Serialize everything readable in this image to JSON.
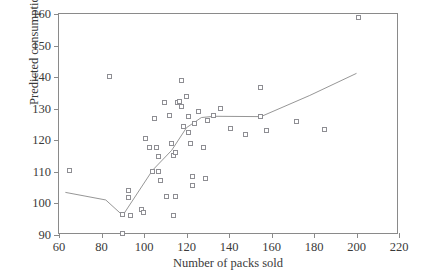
{
  "chart_data": {
    "type": "scatter",
    "title": "",
    "xlabel": "Number of packs sold",
    "ylabel": "Predicted consumption",
    "xlim": [
      60,
      220
    ],
    "ylim": [
      90,
      160
    ],
    "xticks": [
      60,
      80,
      100,
      120,
      140,
      160,
      180,
      200,
      220
    ],
    "yticks": [
      90,
      100,
      110,
      120,
      130,
      140,
      150,
      160
    ],
    "grid": false,
    "legend": null,
    "marker": "open-square",
    "marker_color": "#8e8e93",
    "line_color": "#8a8a8a",
    "axis_color": "#8a8a8a",
    "points": [
      {
        "x": 65,
        "y": 110.2
      },
      {
        "x": 84,
        "y": 140.0
      },
      {
        "x": 90,
        "y": 96.2
      },
      {
        "x": 90,
        "y": 90.4
      },
      {
        "x": 93,
        "y": 103.8
      },
      {
        "x": 93,
        "y": 101.6
      },
      {
        "x": 94,
        "y": 96.1
      },
      {
        "x": 99,
        "y": 97.9
      },
      {
        "x": 100,
        "y": 96.9
      },
      {
        "x": 101,
        "y": 120.4
      },
      {
        "x": 103,
        "y": 117.6
      },
      {
        "x": 104,
        "y": 110.1
      },
      {
        "x": 105,
        "y": 126.9
      },
      {
        "x": 106,
        "y": 117.7
      },
      {
        "x": 107,
        "y": 114.6
      },
      {
        "x": 107,
        "y": 110.0
      },
      {
        "x": 108,
        "y": 107.0
      },
      {
        "x": 110,
        "y": 131.8
      },
      {
        "x": 111,
        "y": 101.9
      },
      {
        "x": 112,
        "y": 127.6
      },
      {
        "x": 113,
        "y": 118.7
      },
      {
        "x": 114,
        "y": 114.9
      },
      {
        "x": 114,
        "y": 95.9
      },
      {
        "x": 115,
        "y": 115.9
      },
      {
        "x": 115,
        "y": 101.9
      },
      {
        "x": 116,
        "y": 131.8
      },
      {
        "x": 117,
        "y": 132.2
      },
      {
        "x": 118,
        "y": 138.8
      },
      {
        "x": 118,
        "y": 130.7
      },
      {
        "x": 119,
        "y": 124.3
      },
      {
        "x": 120,
        "y": 133.6
      },
      {
        "x": 121,
        "y": 127.4
      },
      {
        "x": 121,
        "y": 122.3
      },
      {
        "x": 122,
        "y": 118.9
      },
      {
        "x": 123,
        "y": 108.5
      },
      {
        "x": 123,
        "y": 105.6
      },
      {
        "x": 124,
        "y": 125.1
      },
      {
        "x": 126,
        "y": 129.0
      },
      {
        "x": 128,
        "y": 117.4
      },
      {
        "x": 129,
        "y": 107.7
      },
      {
        "x": 130,
        "y": 126.2
      },
      {
        "x": 133,
        "y": 127.6
      },
      {
        "x": 136,
        "y": 129.9
      },
      {
        "x": 141,
        "y": 123.5
      },
      {
        "x": 148,
        "y": 121.8
      },
      {
        "x": 155,
        "y": 136.6
      },
      {
        "x": 155,
        "y": 127.5
      },
      {
        "x": 158,
        "y": 122.8
      },
      {
        "x": 172,
        "y": 125.9
      },
      {
        "x": 185,
        "y": 123.3
      },
      {
        "x": 201,
        "y": 158.8
      }
    ],
    "fit_line": [
      {
        "x": 63,
        "y": 103.5
      },
      {
        "x": 82,
        "y": 101.1
      },
      {
        "x": 90,
        "y": 96.2
      },
      {
        "x": 104,
        "y": 110.5
      },
      {
        "x": 113,
        "y": 116.8
      },
      {
        "x": 120,
        "y": 124.0
      },
      {
        "x": 127,
        "y": 127.2
      },
      {
        "x": 133,
        "y": 127.6
      },
      {
        "x": 155,
        "y": 127.5
      },
      {
        "x": 178,
        "y": 134.2
      },
      {
        "x": 200,
        "y": 141.2
      }
    ]
  }
}
